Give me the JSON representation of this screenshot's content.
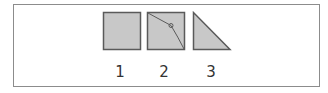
{
  "figure": {
    "items": [
      {
        "label": "1",
        "shape": "square"
      },
      {
        "label": "2",
        "shape": "square-with-fold-line"
      },
      {
        "label": "3",
        "shape": "right-triangle"
      }
    ],
    "colors": {
      "fill": "#c8c8c8",
      "stroke": "#5a5a5a",
      "border": "#8c8c8c",
      "text": "#333333"
    }
  }
}
